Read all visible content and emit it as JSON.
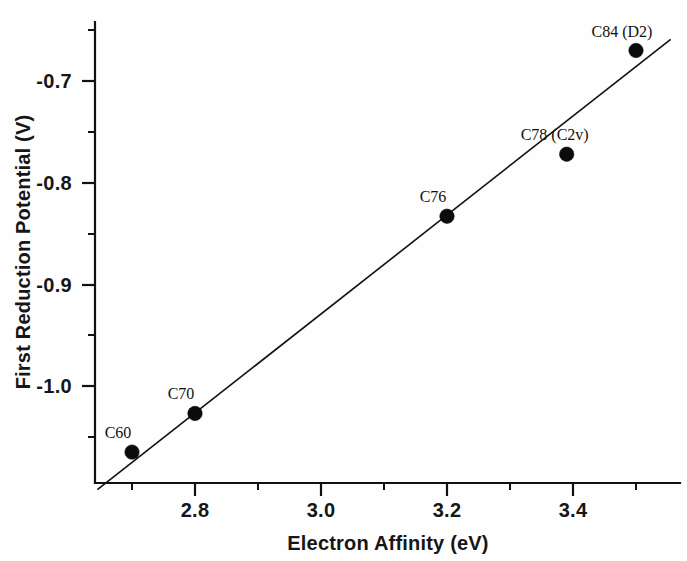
{
  "chart_data": {
    "type": "scatter",
    "title": "",
    "xlabel": "Electron Affinity (eV)",
    "ylabel": "First Reduction Potential (V)",
    "xlim": [
      2.64,
      3.57
    ],
    "ylim": [
      -1.1,
      -0.655
    ],
    "grid": false,
    "legend": "none",
    "x_major_ticks": [
      2.8,
      3.0,
      3.2,
      3.4
    ],
    "x_major_tick_labels": [
      "2.8",
      "3.0",
      "3.2",
      "3.4"
    ],
    "x_minor_ticks": [
      2.7,
      2.9,
      3.1,
      3.3,
      3.5
    ],
    "y_major_ticks": [
      -0.7,
      -0.8,
      -0.9,
      -1.0
    ],
    "y_major_tick_labels": [
      "-0.7",
      "-0.8",
      "-0.9",
      "-1.0"
    ],
    "y_minor_ticks": [
      -0.65,
      -0.75,
      -0.85,
      -0.95,
      -1.05
    ],
    "points": [
      {
        "label": "C60",
        "x": 2.7,
        "y": -1.065,
        "label_dx": -14,
        "label_dy": -14
      },
      {
        "label": "C70",
        "x": 2.8,
        "y": -1.027,
        "label_dx": -14,
        "label_dy": -14
      },
      {
        "label": "C76",
        "x": 3.2,
        "y": -0.833,
        "label_dx": -14,
        "label_dy": -14
      },
      {
        "label": "C78 (C2v)",
        "x": 3.39,
        "y": -0.772,
        "label_dx": -12,
        "label_dy": -14
      },
      {
        "label": "C84 (D2)",
        "x": 3.5,
        "y": -0.67,
        "label_dx": -14,
        "label_dy": -14
      }
    ],
    "fit_line": {
      "name": "linear trend",
      "x_start": 2.645,
      "y_start": -1.102,
      "x_end": 3.555,
      "y_end": -0.659
    },
    "series": [
      {
        "name": "Fullerene first reduction potential vs electron affinity",
        "x": [
          2.7,
          2.8,
          3.2,
          3.39,
          3.5
        ],
        "values": [
          -1.065,
          -1.027,
          -0.833,
          -0.772,
          -0.67
        ],
        "point_labels": [
          "C60",
          "C70",
          "C76",
          "C78 (C2v)",
          "C84 (D2)"
        ]
      }
    ],
    "colors": {
      "marker": "#0b0b0b",
      "line": "#111111",
      "axis": "#111111",
      "text": "#161616",
      "background": "#ffffff"
    }
  }
}
